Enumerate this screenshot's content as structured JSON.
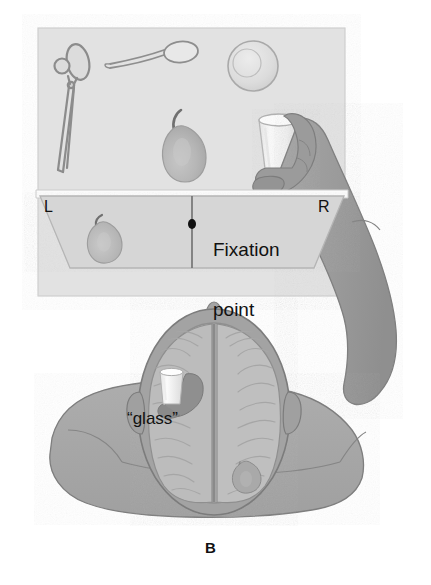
{
  "figure": {
    "panel_label": "B",
    "type": "split-brain tachistoscope illustration",
    "colors": {
      "page_background": "#ffffff",
      "table_panel": "#e2e2e2",
      "screen_panel": "#d8d8d8",
      "body_skin": "#a8a8a8",
      "arm_skin": "#9c9c9c",
      "skull": "#a3a3a3",
      "brain_tissue": "#bdbdbd",
      "object_outline": "#8e8e8e",
      "glass_fill": "#f2f2f2",
      "pear_fill": "#b4b4b4",
      "text": "#111111"
    }
  },
  "scene": {
    "table": {
      "name": "table surface with objects",
      "objects": [
        {
          "id": "scissors",
          "label": "scissors",
          "icon": "scissors-icon"
        },
        {
          "id": "spoon",
          "label": "spoon",
          "icon": "spoon-icon"
        },
        {
          "id": "ball",
          "label": "ball",
          "icon": "ball-icon"
        },
        {
          "id": "pear",
          "label": "pear",
          "icon": "pear-icon"
        },
        {
          "id": "glass",
          "label": "glass",
          "icon": "glass-icon"
        }
      ]
    },
    "screen": {
      "name": "viewing screen",
      "left_field_label": "L",
      "right_field_label": "R",
      "fixation_label_line1": "Fixation",
      "fixation_label_line2": "point",
      "fixation_label": "Fixation point",
      "stimulus_left_visual_field": "pear"
    },
    "hand": {
      "name": "right hand grasping object",
      "held_object": "glass"
    }
  },
  "brain": {
    "name": "top-down head and brain cross-section",
    "left_hemisphere": {
      "contents_label": "“glass”",
      "image": "glass-in-hand"
    },
    "right_hemisphere": {
      "contents_label": "",
      "image": "pear"
    },
    "midline": "interhemispheric fissure"
  },
  "labels": {
    "L": "L",
    "R": "R",
    "fixation_line1": "Fixation",
    "fixation_line2": "point",
    "glass_quoted": "“glass”",
    "panel": "B"
  }
}
